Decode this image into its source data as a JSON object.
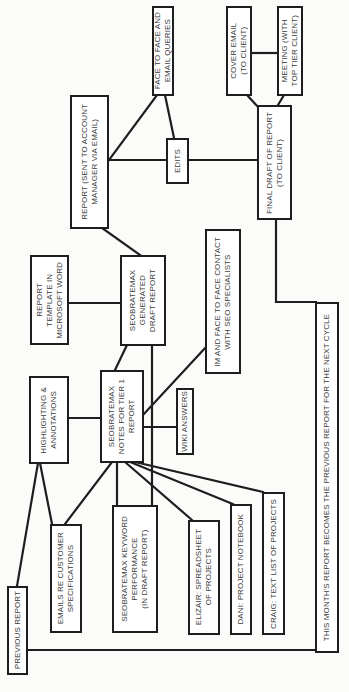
{
  "diagram": {
    "orientation": "rotated-90-ccw",
    "colors": {
      "line": "#1e1e1e",
      "text": "#3a3a3a",
      "box_fill": "#ffffff",
      "background": "#fbfbf9"
    },
    "nodes": [
      {
        "id": "face_to_face_email",
        "label": "Face to face and\nemail queries"
      },
      {
        "id": "report_sent",
        "label": "Report (sent to account\nmanager via email)"
      },
      {
        "id": "edits",
        "label": "Edits"
      },
      {
        "id": "cover_email",
        "label": "Cover email\n(to client)"
      },
      {
        "id": "meeting",
        "label": "Meeting (with\ntop tier client)"
      },
      {
        "id": "final_draft",
        "label": "Final draft of report\n(to client)"
      },
      {
        "id": "report_template",
        "label": "Report\ntemplate in\nMicrosoft Word"
      },
      {
        "id": "generated_draft",
        "label": "SEOBRATEMAX\ngenerated\ndraft report"
      },
      {
        "id": "im_face_contact",
        "label": "IM and face to face contact\nwith SEO specialists"
      },
      {
        "id": "highlighting",
        "label": "Highlighting &\nannotations"
      },
      {
        "id": "notes_tier1",
        "label": "SEOBRATEMAX\nnotes for tier 1\nreport"
      },
      {
        "id": "wiki_answers",
        "label": "Wiki answers"
      },
      {
        "id": "next_cycle",
        "label": "This month's report becomes the previous report for the next cycle"
      },
      {
        "id": "emails_customer",
        "label": "Emails re customer\nspecifications"
      },
      {
        "id": "keyword_perf",
        "label": "SEOBRATEMAX keyword\nperformance\n(in draft report)"
      },
      {
        "id": "elizair",
        "label": "Elizair: spreadsheet\nof projects"
      },
      {
        "id": "dani",
        "label": "Dani: project notebook"
      },
      {
        "id": "craig",
        "label": "Craig: text list of projects"
      },
      {
        "id": "previous_report",
        "label": "Previous report"
      }
    ],
    "edges": [
      [
        "face_to_face_email",
        "report_sent"
      ],
      [
        "face_to_face_email",
        "edits"
      ],
      [
        "report_sent",
        "edits"
      ],
      [
        "edits",
        "final_draft"
      ],
      [
        "cover_email",
        "meeting"
      ],
      [
        "cover_email",
        "final_draft"
      ],
      [
        "meeting",
        "final_draft"
      ],
      [
        "report_sent",
        "generated_draft"
      ],
      [
        "report_template",
        "generated_draft"
      ],
      [
        "generated_draft",
        "notes_tier1"
      ],
      [
        "generated_draft",
        "keyword_perf"
      ],
      [
        "highlighting",
        "notes_tier1"
      ],
      [
        "notes_tier1",
        "im_face_contact"
      ],
      [
        "notes_tier1",
        "wiki_answers"
      ],
      [
        "notes_tier1",
        "emails_customer"
      ],
      [
        "notes_tier1",
        "keyword_perf"
      ],
      [
        "notes_tier1",
        "elizair"
      ],
      [
        "notes_tier1",
        "dani"
      ],
      [
        "notes_tier1",
        "craig"
      ],
      [
        "highlighting",
        "emails_customer"
      ],
      [
        "highlighting",
        "previous_report"
      ],
      [
        "final_draft",
        "next_cycle"
      ],
      [
        "next_cycle",
        "previous_report"
      ]
    ]
  }
}
